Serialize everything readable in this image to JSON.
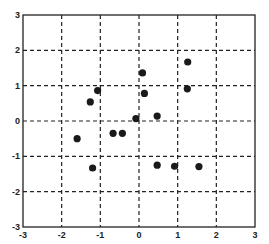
{
  "chart_data": {
    "type": "scatter",
    "title": "",
    "xlabel": "",
    "ylabel": "",
    "xlim": [
      -3,
      3
    ],
    "ylim": [
      -3,
      3
    ],
    "grid": true,
    "grid_style": "dashed",
    "legend": null,
    "x_ticks": [
      -3,
      -2,
      -1,
      0,
      1,
      2,
      3
    ],
    "y_ticks": [
      -3,
      -2,
      -1,
      0,
      1,
      2,
      3
    ],
    "marker": "filled-circle",
    "marker_color": "#1a1a1a",
    "series": [
      {
        "name": "points",
        "points": [
          {
            "x": -1.07,
            "y": 0.86
          },
          {
            "x": -1.26,
            "y": 0.54
          },
          {
            "x": 0.09,
            "y": 1.36
          },
          {
            "x": 0.14,
            "y": 0.78
          },
          {
            "x": 1.26,
            "y": 1.67
          },
          {
            "x": 1.25,
            "y": 0.91
          },
          {
            "x": -0.08,
            "y": 0.07
          },
          {
            "x": 0.47,
            "y": 0.14
          },
          {
            "x": -0.67,
            "y": -0.35
          },
          {
            "x": -0.43,
            "y": -0.35
          },
          {
            "x": -1.6,
            "y": -0.5
          },
          {
            "x": -1.2,
            "y": -1.33
          },
          {
            "x": 0.47,
            "y": -1.25
          },
          {
            "x": 0.92,
            "y": -1.28
          },
          {
            "x": 1.55,
            "y": -1.29
          }
        ]
      }
    ]
  }
}
